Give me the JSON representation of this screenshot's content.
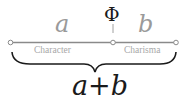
{
  "diagram": {
    "ratio_symbol": "Φ",
    "segment_a": {
      "variable": "a",
      "label": "Character"
    },
    "segment_b": {
      "variable": "b",
      "label": "Charisma"
    },
    "total": {
      "label": "a+b"
    },
    "colors": {
      "line": "#8a8a8a",
      "label_text": "#a8a8a8",
      "variable_text": "#9a9a9a",
      "dark_text": "#1a1a1a"
    }
  }
}
